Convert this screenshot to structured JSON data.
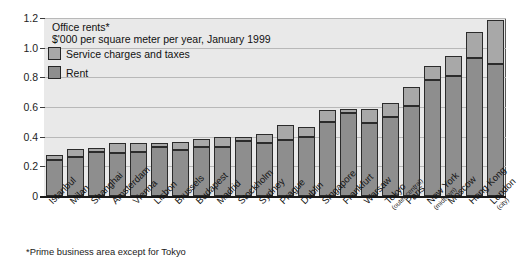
{
  "chart_data": {
    "type": "bar",
    "subtype": "stacked-vertical",
    "title": "Office rents*",
    "subtitle": "$'000 per square meter per year, January 1999",
    "footnote": "*Prime business area except for Tokyo",
    "xlabel": "",
    "ylabel": "",
    "ylim": [
      0,
      1.2
    ],
    "yticks": [
      "0",
      "0.2",
      "0.4",
      "0.6",
      "0.8",
      "1.0",
      "1.2"
    ],
    "ytick_values": [
      0,
      0.2,
      0.4,
      0.6,
      0.8,
      1.0,
      1.2
    ],
    "grid": true,
    "legend_position": "top-left",
    "categories": [
      "Istanbul",
      "Milan",
      "Shanghai",
      "Amsterdam",
      "Vienna",
      "Lisbon",
      "Brussels",
      "Budapest",
      "Madrid",
      "Stockholm",
      "Sydney",
      "Prague",
      "Dublin",
      "Singapore",
      "Frankfurt",
      "Warsaw",
      "Tokyo",
      "Paris",
      "New York",
      "Moscow",
      "Hong Kong",
      "London"
    ],
    "category_subs": [
      "",
      "",
      "",
      "",
      "",
      "",
      "",
      "",
      "",
      "",
      "",
      "",
      "",
      "",
      "",
      "",
      "(outer central)",
      "",
      "(midtown)",
      "",
      "",
      "(city)"
    ],
    "series": [
      {
        "name": "Rent",
        "color": "#8e8e8e",
        "values": [
          0.24,
          0.26,
          0.3,
          0.29,
          0.3,
          0.33,
          0.31,
          0.33,
          0.33,
          0.37,
          0.36,
          0.38,
          0.4,
          0.5,
          0.56,
          0.49,
          0.53,
          0.61,
          0.78,
          0.81,
          0.93,
          0.89
        ]
      },
      {
        "name": "Service charges and taxes",
        "color": "#a8a8a8",
        "values": [
          0.03,
          0.05,
          0.02,
          0.06,
          0.05,
          0.02,
          0.05,
          0.05,
          0.06,
          0.02,
          0.05,
          0.09,
          0.06,
          0.07,
          0.02,
          0.09,
          0.09,
          0.12,
          0.09,
          0.13,
          0.17,
          0.29
        ]
      }
    ],
    "totals": [
      0.27,
      0.31,
      0.32,
      0.35,
      0.35,
      0.35,
      0.36,
      0.38,
      0.39,
      0.39,
      0.41,
      0.47,
      0.46,
      0.57,
      0.58,
      0.58,
      0.62,
      0.73,
      0.87,
      0.94,
      1.1,
      1.18
    ]
  },
  "colors": {
    "plot_background": "#e9e9e9",
    "page_background": "#ffffff",
    "gridline": "#b8b8b8",
    "axis": "#1a1a1a",
    "rent": "#8e8e8e",
    "service": "#a8a8a8",
    "bar_outline": "#2b2b2b"
  }
}
